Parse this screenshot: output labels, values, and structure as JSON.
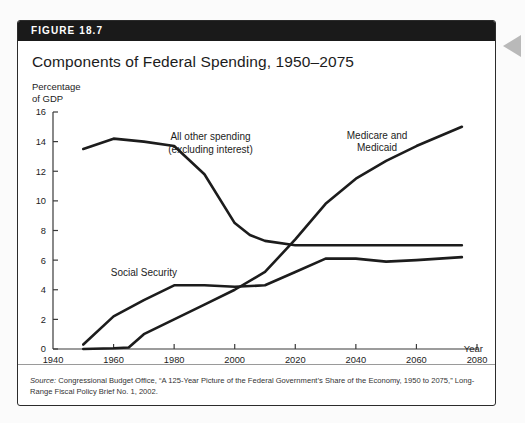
{
  "figure": {
    "label": "FIGURE 18.7",
    "title": "Components of Federal Spending, 1950–2075",
    "source_prefix": "Source:",
    "source_text": " Congressional Budget Office, “A 125-Year Picture of the Federal Government’s Share of the Economy, 1950 to 2075,” Long-Range Fiscal Policy Brief No. 1, 2002.",
    "header_bg": "#1a1a1a",
    "line_color": "#1c1c1c",
    "side_arrow_color": "#b9b9b9"
  },
  "chart_data": {
    "type": "line",
    "title": "Components of Federal Spending, 1950–2075",
    "xlabel": "Year",
    "ylabel": "Percentage\nof GDP",
    "ylabel_line1": "Percentage",
    "ylabel_line2": "of GDP",
    "xlim": [
      1940,
      2080
    ],
    "ylim": [
      0,
      16
    ],
    "xticks": [
      1940,
      1960,
      1980,
      2000,
      2020,
      2040,
      2060,
      2080
    ],
    "xtick_labels": [
      "1940",
      "1960",
      "1980",
      "2000",
      "2020",
      "2040",
      "2060",
      "2080"
    ],
    "yticks": [
      0,
      2,
      4,
      6,
      8,
      10,
      12,
      14,
      16
    ],
    "ytick_labels": [
      "0",
      "2",
      "4",
      "6",
      "8",
      "10",
      "12",
      "14",
      "16"
    ],
    "grid": false,
    "legend": "inline-annotations",
    "series": [
      {
        "name": "All other spending (excluding interest)",
        "label_line1": "All other spending",
        "label_line2": "(excluding interest)",
        "label_x": 1992,
        "label_y": 14.1,
        "x": [
          1950,
          1960,
          1970,
          1980,
          1990,
          2000,
          2005,
          2010,
          2020,
          2030,
          2040,
          2050,
          2060,
          2075
        ],
        "y": [
          13.5,
          14.2,
          14.0,
          13.7,
          11.8,
          8.5,
          7.7,
          7.3,
          7.0,
          7.0,
          7.0,
          7.0,
          7.0,
          7.0
        ]
      },
      {
        "name": "Social Security",
        "label_line1": "Social Security",
        "label_line2": "",
        "label_x": 1970,
        "label_y": 4.9,
        "x": [
          1950,
          1960,
          1970,
          1980,
          1990,
          2000,
          2010,
          2020,
          2030,
          2040,
          2050,
          2060,
          2075
        ],
        "y": [
          0.3,
          2.2,
          3.3,
          4.3,
          4.3,
          4.2,
          4.3,
          5.2,
          6.1,
          6.1,
          5.9,
          6.0,
          6.2
        ]
      },
      {
        "name": "Medicare and Medicaid",
        "label_line1": "Medicare and",
        "label_line2": "Medicaid",
        "label_x": 2047,
        "label_y": 14.2,
        "x": [
          1950,
          1960,
          1965,
          1970,
          1980,
          1990,
          2000,
          2010,
          2020,
          2030,
          2040,
          2050,
          2060,
          2075
        ],
        "y": [
          0.0,
          0.05,
          0.1,
          1.0,
          2.0,
          3.0,
          4.0,
          5.2,
          7.4,
          9.8,
          11.5,
          12.7,
          13.7,
          15.0
        ]
      }
    ]
  }
}
